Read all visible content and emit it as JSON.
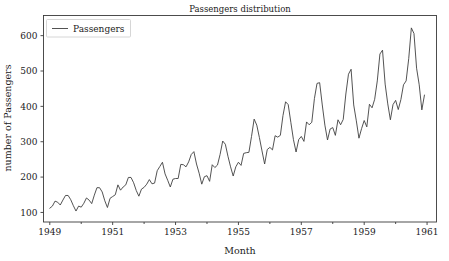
{
  "chart_data": {
    "type": "line",
    "title": "Passengers distribution",
    "xlabel": "Month",
    "ylabel": "number of Passengers",
    "grid": false,
    "legend_position": "upper left",
    "legend_entries": [
      "Passengers"
    ],
    "series": [
      {
        "name": "Passengers",
        "color": "#404040",
        "values": [
          112,
          118,
          132,
          129,
          121,
          135,
          148,
          148,
          136,
          119,
          104,
          118,
          115,
          126,
          141,
          135,
          125,
          149,
          170,
          170,
          158,
          133,
          114,
          140,
          145,
          150,
          178,
          163,
          172,
          178,
          199,
          199,
          184,
          162,
          146,
          166,
          171,
          180,
          193,
          181,
          183,
          218,
          230,
          242,
          209,
          191,
          172,
          194,
          196,
          196,
          236,
          235,
          229,
          243,
          264,
          272,
          237,
          211,
          180,
          201,
          204,
          188,
          235,
          227,
          234,
          264,
          302,
          293,
          259,
          229,
          203,
          229,
          242,
          233,
          267,
          269,
          270,
          315,
          364,
          347,
          312,
          274,
          237,
          278,
          284,
          277,
          317,
          313,
          318,
          374,
          413,
          405,
          355,
          306,
          271,
          306,
          315,
          301,
          356,
          348,
          355,
          422,
          465,
          467,
          404,
          347,
          305,
          336,
          340,
          318,
          362,
          348,
          363,
          435,
          491,
          505,
          404,
          359,
          310,
          337,
          360,
          342,
          406,
          396,
          420,
          472,
          548,
          559,
          463,
          407,
          362,
          405,
          417,
          391,
          419,
          461,
          472,
          535,
          622,
          606,
          508,
          461,
          390,
          432
        ]
      }
    ],
    "x": {
      "start_year": 1949,
      "start_month": 1,
      "end_year": 1960,
      "end_month": 12,
      "tick_labels": [
        "1949",
        "1951",
        "1953",
        "1955",
        "1957",
        "1959",
        "1961"
      ],
      "tick_values": [
        1949,
        1951,
        1953,
        1955,
        1957,
        1959,
        1961
      ],
      "xlim": [
        1948.8,
        1961.3
      ]
    },
    "y": {
      "tick_labels": [
        "100",
        "200",
        "300",
        "400",
        "500",
        "600"
      ],
      "tick_values": [
        100,
        200,
        300,
        400,
        500,
        600
      ],
      "ylim": [
        73,
        657
      ]
    },
    "colors": {
      "line": "#404040",
      "axis": "#3a3a3a",
      "text": "#222222",
      "background": "#ffffff",
      "legend_border": "#cccccc"
    }
  }
}
